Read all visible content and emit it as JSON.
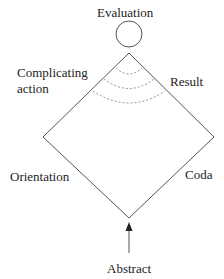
{
  "diagram": {
    "labels": {
      "evaluation": "Evaluation",
      "complicating_action_line1": "Complicating",
      "complicating_action_line2": "action",
      "result": "Result",
      "orientation": "Orientation",
      "coda": "Coda",
      "abstract": "Abstract"
    },
    "colors": {
      "line": "#555555",
      "dashed": "#777777",
      "text": "#222222"
    }
  }
}
